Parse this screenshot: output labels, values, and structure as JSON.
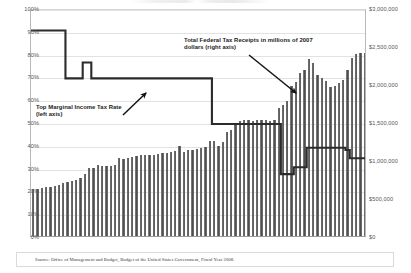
{
  "source": {
    "text": "Source: Office of Management and Budget, Budget of the United States Government, Fiscal Year 2008."
  },
  "annotations": {
    "receipts": "Total Federal Tax Receipts in millions of 2007 dollars (right axis)",
    "rate": "Top Marginal Income Tax Rate (left axis)"
  },
  "axes": {
    "left_ticks": [
      "100%",
      "90%",
      "80%",
      "70%",
      "60%",
      "50%",
      "40%",
      "30%",
      "20%",
      "10%",
      "0%"
    ],
    "right_ticks": [
      "$3,000,000",
      "$2,500,000",
      "$2,000,000",
      "$1,500,000",
      "$1,000,000",
      "$500,000",
      "$0"
    ]
  },
  "chart_data": {
    "type": "bar",
    "title": "",
    "subtitle": "",
    "xlabel": "",
    "ylabel": "Top Marginal Income Tax Rate",
    "y2label": "Total Federal Tax Receipts in millions of 2007 dollars",
    "ylim": [
      0,
      1.0
    ],
    "y2lim": [
      0,
      3000000
    ],
    "yticks": [
      0,
      0.1,
      0.2,
      0.3,
      0.4,
      0.5,
      0.6,
      0.7,
      0.8,
      0.9,
      1.0
    ],
    "y2ticks": [
      0,
      500000,
      1000000,
      1500000,
      2000000,
      2500000,
      3000000
    ],
    "grid": true,
    "legend_position": "annotations",
    "x": [
      1930,
      1931,
      1932,
      1933,
      1934,
      1935,
      1936,
      1937,
      1938,
      1939,
      1940,
      1941,
      1942,
      1943,
      1944,
      1945,
      1946,
      1947,
      1948,
      1949,
      1950,
      1951,
      1952,
      1953,
      1954,
      1955,
      1956,
      1957,
      1958,
      1959,
      1960,
      1961,
      1962,
      1963,
      1964,
      1965,
      1966,
      1967,
      1968,
      1969,
      1970,
      1971,
      1972,
      1973,
      1974,
      1975,
      1976,
      1977,
      1978,
      1979,
      1980,
      1981,
      1982,
      1983,
      1984,
      1985,
      1986,
      1987,
      1988,
      1989,
      1990,
      1991,
      1992,
      1993,
      1994,
      1995,
      1996,
      1997,
      1998,
      1999,
      2000,
      2001,
      2002,
      2003,
      2004,
      2005,
      2006,
      2007
    ],
    "series": [
      {
        "name": "Total Federal Tax Receipts in millions of 2007 dollars (right axis)",
        "type": "bar",
        "axis": "right",
        "color": "#5a5a5a",
        "values": [
          620000,
          622000,
          628000,
          640000,
          648000,
          660000,
          672000,
          700000,
          712000,
          730000,
          742000,
          760000,
          818000,
          898000,
          900000,
          930000,
          920000,
          918000,
          918000,
          930000,
          1028000,
          1010000,
          1022000,
          1040000,
          1058000,
          1060000,
          1070000,
          1065000,
          1060000,
          1075000,
          1090000,
          1095000,
          1105000,
          1118000,
          1190000,
          1110000,
          1128000,
          1135000,
          1140000,
          1162000,
          1170000,
          1250000,
          1255000,
          1178000,
          1240000,
          1368000,
          1390000,
          1475000,
          1512000,
          1528000,
          1525000,
          1512000,
          1528000,
          1525000,
          1530000,
          1518000,
          1530000,
          1680000,
          1730000,
          1770000,
          1980000,
          2030000,
          2150000,
          2180000,
          2330000,
          2270000,
          2120000,
          2075000,
          2045000,
          1965000,
          1980000,
          2010000,
          2050000,
          2180000,
          2340000,
          2400000,
          2410000,
          2410000
        ]
      },
      {
        "name": "Top Marginal Income Tax Rate (left axis)",
        "type": "line",
        "axis": "left",
        "color": "#2b2b2b",
        "values": [
          0.91,
          0.91,
          0.91,
          0.91,
          0.91,
          0.91,
          0.91,
          0.91,
          0.7,
          0.7,
          0.7,
          0.7,
          0.77,
          0.77,
          0.7,
          0.7,
          0.7,
          0.7,
          0.7,
          0.7,
          0.7,
          0.7,
          0.7,
          0.7,
          0.7,
          0.7,
          0.7,
          0.7,
          0.7,
          0.7,
          0.7,
          0.7,
          0.7,
          0.7,
          0.7,
          0.7,
          0.7,
          0.7,
          0.7,
          0.7,
          0.7,
          0.7,
          0.5,
          0.5,
          0.5,
          0.5,
          0.5,
          0.5,
          0.5,
          0.5,
          0.5,
          0.5,
          0.5,
          0.5,
          0.5,
          0.5,
          0.5,
          0.5,
          0.28,
          0.28,
          0.28,
          0.31,
          0.31,
          0.31,
          0.396,
          0.396,
          0.396,
          0.396,
          0.396,
          0.396,
          0.396,
          0.396,
          0.396,
          0.386,
          0.35,
          0.35,
          0.35,
          0.35
        ]
      }
    ]
  }
}
